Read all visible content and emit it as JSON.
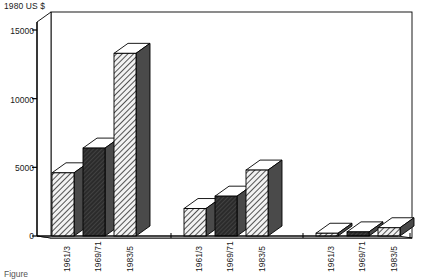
{
  "unit_caption": "1980 US $",
  "figure_caption": "Figure",
  "axis": {
    "y_ticks": [
      0,
      5000,
      10000,
      15000
    ],
    "y_tick_labels": [
      "0",
      "5000",
      "10000",
      "15000"
    ],
    "y_min": 0,
    "y_max": 15000
  },
  "annotations": [
    {
      "name": "developed-market-economies",
      "text": "Developed market\neconomies"
    },
    {
      "name": "european-centrally-planned-economies",
      "text": "European\ncentrally planned\neconomies"
    },
    {
      "name": "developing-countries",
      "text": "Developing\ncountries"
    }
  ],
  "category_labels": [
    "1961/3",
    "1969/71",
    "1983/5",
    "1961/3",
    "1969/71",
    "1983/5",
    "1961/3",
    "1969/71",
    "1983/5"
  ],
  "colors": {
    "outline": "#000000",
    "face_light_hatch": "#e8e8e8",
    "face_dark": "#3a3a3a",
    "side_dark": "#4a4a4a",
    "top_white": "#ffffff",
    "frame": "#000000",
    "background": "#ffffff"
  },
  "chart_data": {
    "type": "bar",
    "title": "",
    "subtitle": "",
    "xlabel": "",
    "ylabel": "1980 US $",
    "ylim": [
      0,
      15000
    ],
    "grid": false,
    "legend": "none",
    "style": "3d-bar",
    "groups": [
      {
        "name": "Developed market economies",
        "categories": [
          "1961/3",
          "1969/71",
          "1983/5"
        ],
        "values": [
          4600,
          6400,
          13300
        ],
        "fills": [
          "light-hatch",
          "dark-solid",
          "light-hatch"
        ]
      },
      {
        "name": "European centrally planned economies",
        "categories": [
          "1961/3",
          "1969/71",
          "1983/5"
        ],
        "values": [
          2000,
          2900,
          4800
        ],
        "fills": [
          "light-hatch",
          "dark-solid",
          "light-hatch"
        ]
      },
      {
        "name": "Developing countries",
        "categories": [
          "1961/3",
          "1969/71",
          "1983/5"
        ],
        "values": [
          200,
          300,
          600
        ],
        "fills": [
          "light-hatch",
          "dark-solid",
          "light-hatch"
        ]
      }
    ],
    "categories": [
      "1961/3",
      "1969/71",
      "1983/5"
    ],
    "series": [
      {
        "name": "Developed market economies",
        "values": [
          4600,
          6400,
          13300
        ]
      },
      {
        "name": "European centrally planned economies",
        "values": [
          2000,
          2900,
          4800
        ]
      },
      {
        "name": "Developing countries",
        "values": [
          200,
          300,
          600
        ]
      }
    ]
  }
}
